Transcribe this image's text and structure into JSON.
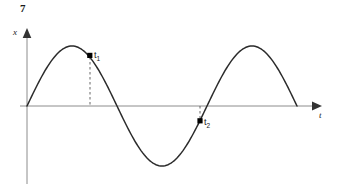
{
  "figure": {
    "number": "7",
    "background_color": "#ffffff",
    "curve_color": "#1a1a1a",
    "axis_color": "#808080",
    "marker_color": "#000000",
    "width": 338,
    "height": 186
  },
  "axes": {
    "vertical": {
      "label": "x",
      "name": "displacement-axis",
      "x_px": 27,
      "top_px": 28,
      "bottom_px": 184,
      "arrow": "up"
    },
    "horizontal": {
      "label": "t",
      "name": "time-axis",
      "y_px": 106,
      "left_px": 20,
      "right_px": 322,
      "arrow": "right"
    }
  },
  "markers": [
    {
      "label": "t",
      "subscript": "1",
      "name": "point-t1",
      "x_px": 90,
      "y_px": 56,
      "guide": "dashed-down-to-axis"
    },
    {
      "label": "t",
      "subscript": "2",
      "name": "point-t2",
      "x_px": 200,
      "y_px": 121,
      "guide": "dashed-up-to-axis"
    }
  ],
  "chart_data": {
    "type": "line",
    "title": "",
    "xlabel": "t",
    "ylabel": "x",
    "grid": false,
    "legend": null,
    "function": "x(t) = A sin(2*pi*t/T)",
    "amplitude_px": 60,
    "period_px": 180,
    "origin_px": [
      27,
      106
    ],
    "x_px_range": [
      27,
      297
    ],
    "y_px_range": [
      46,
      166
    ],
    "key_points": [
      {
        "name": "origin",
        "x_px": 27,
        "y_px": 106,
        "phase": "0",
        "value": 0
      },
      {
        "name": "first-crest",
        "x_px": 72,
        "y_px": 46,
        "phase": "T/4",
        "value": 1
      },
      {
        "name": "first-zero-descending",
        "x_px": 117,
        "y_px": 106,
        "phase": "T/2",
        "value": 0
      },
      {
        "name": "trough",
        "x_px": 162,
        "y_px": 166,
        "phase": "3T/4",
        "value": -1
      },
      {
        "name": "second-zero-ascending",
        "x_px": 207,
        "y_px": 106,
        "phase": "T",
        "value": 0
      },
      {
        "name": "second-crest",
        "x_px": 252,
        "y_px": 46,
        "phase": "5T/4",
        "value": 1
      },
      {
        "name": "end",
        "x_px": 297,
        "y_px": 106,
        "phase": "3T/2",
        "value": 0
      }
    ],
    "annotations": [
      {
        "text": "t1",
        "x_px": 90,
        "y_px": 56,
        "note": "point on descending portion of first crest, above axis"
      },
      {
        "text": "t2",
        "x_px": 200,
        "y_px": 121,
        "note": "point on ascending portion after trough, below axis"
      }
    ]
  }
}
